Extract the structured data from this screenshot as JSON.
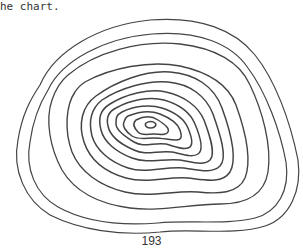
{
  "text_fragment": "he chart.",
  "figure": {
    "type": "topographic contour map",
    "contour_count": 12,
    "line_color": "#444444"
  },
  "page_number": "193"
}
